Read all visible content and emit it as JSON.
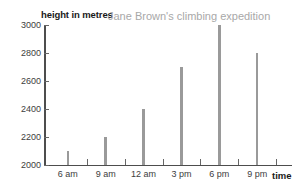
{
  "chart_data": {
    "type": "bar",
    "title": "Jane Brown's climbing expedition",
    "xlabel": "time",
    "ylabel": "height in metres",
    "categories": [
      "6 am",
      "9 am",
      "12 am",
      "3 pm",
      "6 pm",
      "9 pm"
    ],
    "values": [
      2100,
      2200,
      2400,
      2700,
      3000,
      2800
    ],
    "ylim": [
      2000,
      3000
    ],
    "yticks": [
      2000,
      2200,
      2400,
      2600,
      2800,
      3000
    ],
    "ytick_labels": [
      "2000",
      "2200",
      "2400",
      "2600",
      "2800",
      "3000"
    ],
    "grid": false,
    "legend": "none",
    "colors": {
      "bar": "#9a9a9a",
      "axis": "#4d4d4d",
      "title": "#a8a8a8",
      "text": "#3d3d3d",
      "background": "#ffffff"
    }
  }
}
